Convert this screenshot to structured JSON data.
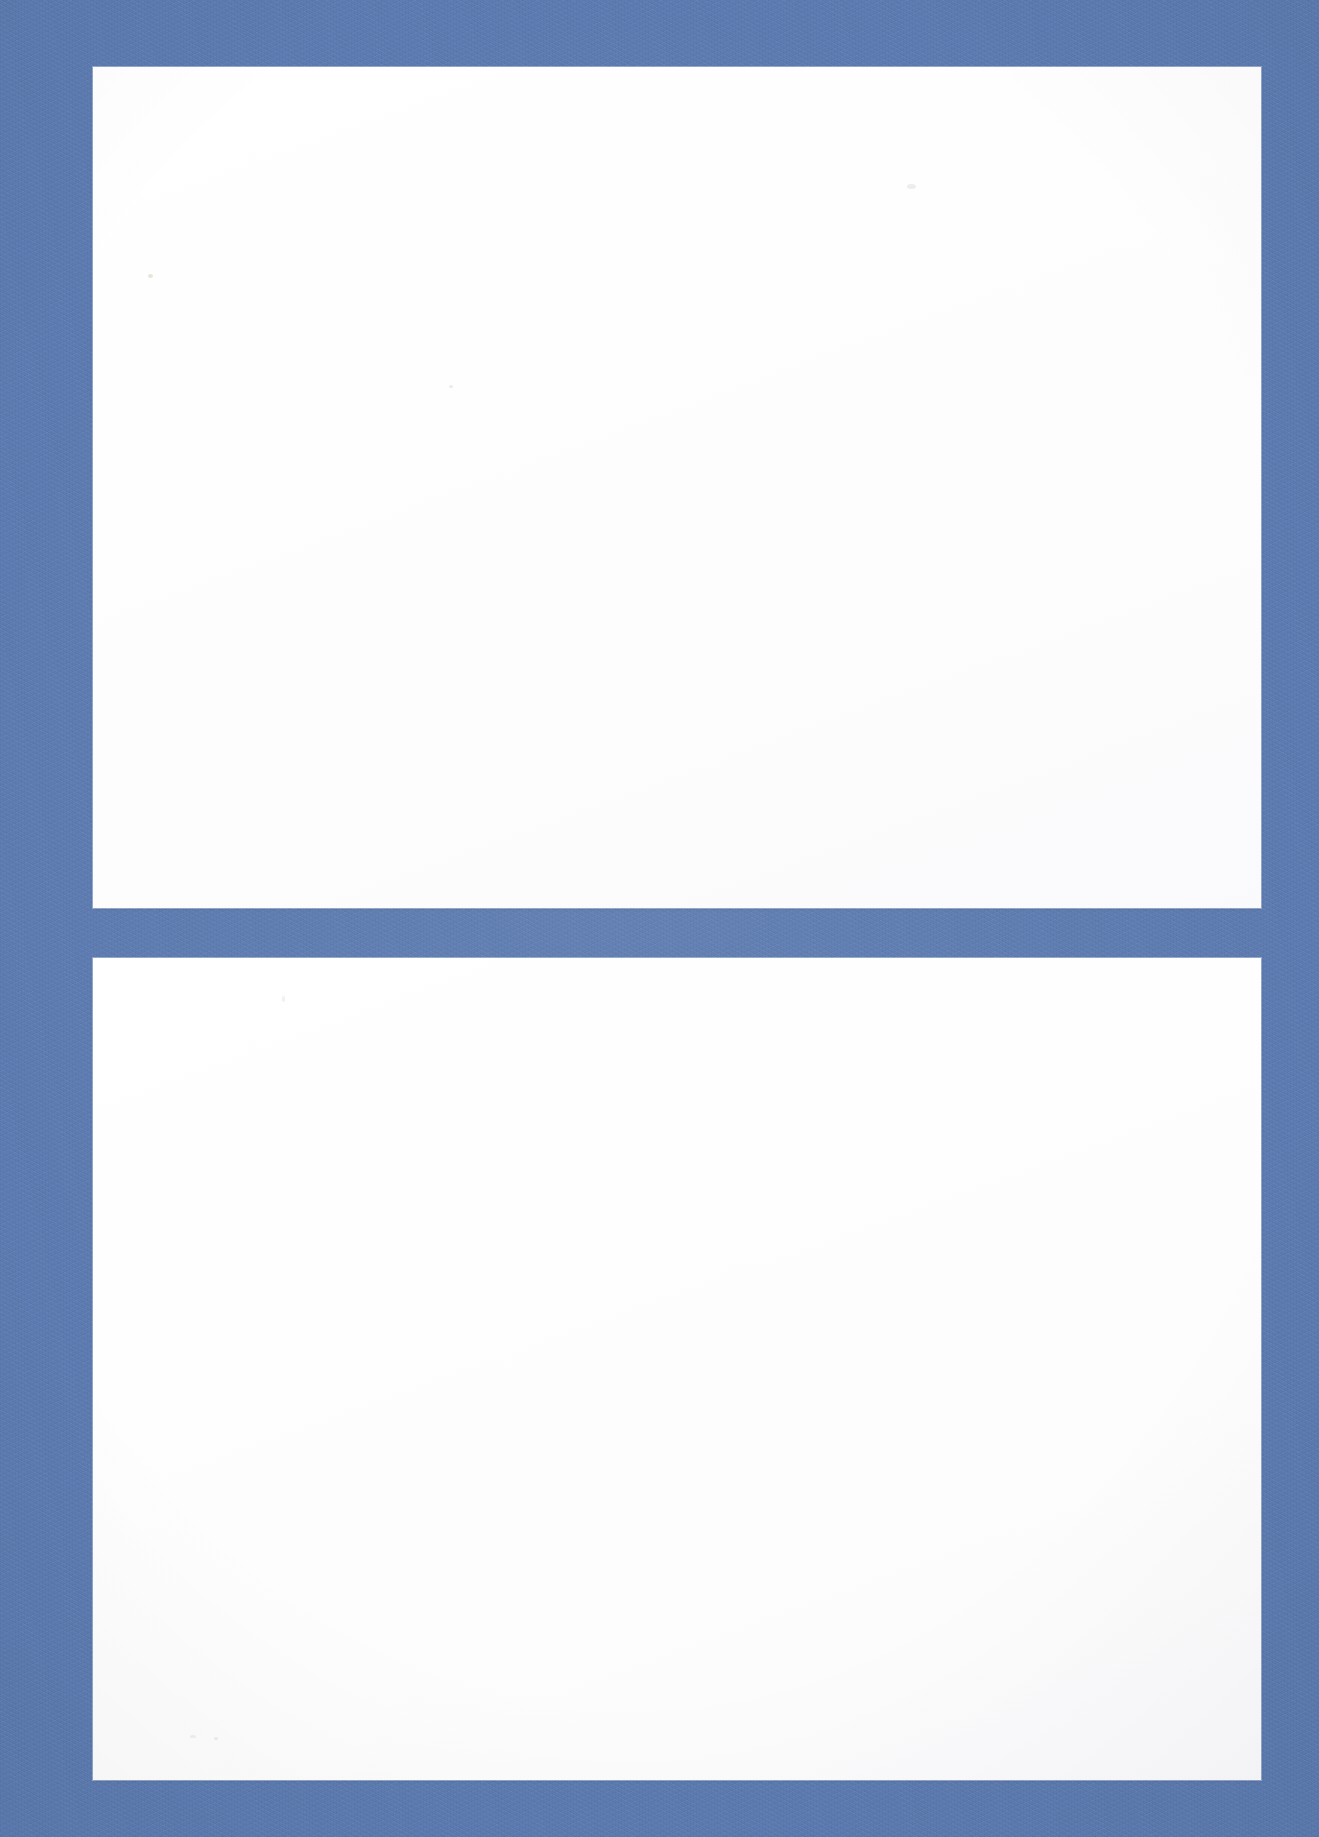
{
  "page": {
    "kind": "scanned-page",
    "width": 1319,
    "height": 1837,
    "background_color": "#5b7ab0",
    "panel_color": "#ffffff",
    "text_content": "",
    "visible_text_count": 0
  },
  "panels": [
    {
      "name": "upper-panel",
      "label": "",
      "content": "",
      "fill": "#ffffff",
      "left": 93,
      "top": 67,
      "width": 1168,
      "height": 841
    },
    {
      "name": "lower-panel",
      "label": "",
      "content": "",
      "fill": "#ffffff",
      "left": 93,
      "top": 958,
      "width": 1168,
      "height": 822
    }
  ],
  "divider": {
    "name": "panel-divider-band",
    "color": "#5b7ab0",
    "top": 908,
    "height": 50
  },
  "margins": {
    "left": 93,
    "right": 58,
    "top": 67,
    "bottom": 57
  },
  "artifacts": [
    {
      "name": "dust-speck",
      "left": 148,
      "top": 274,
      "variant": "speck-a"
    },
    {
      "name": "dust-speck",
      "left": 449,
      "top": 385,
      "variant": "speck-b"
    },
    {
      "name": "dust-speck",
      "left": 907,
      "top": 184,
      "variant": "speck-c"
    },
    {
      "name": "dust-speck",
      "left": 282,
      "top": 996,
      "variant": "speck-d"
    },
    {
      "name": "dust-speck",
      "left": 190,
      "top": 1735,
      "variant": "speck-e"
    },
    {
      "name": "dust-speck",
      "left": 214,
      "top": 1737,
      "variant": "speck-b"
    }
  ]
}
